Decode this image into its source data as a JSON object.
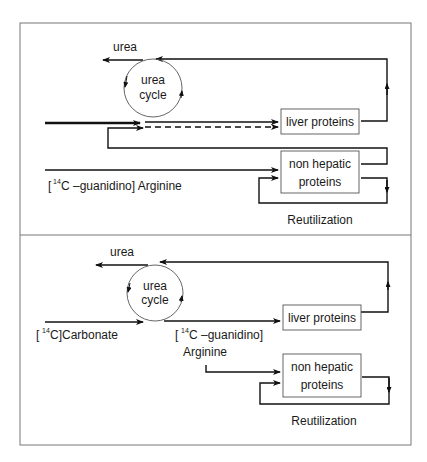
{
  "diagram": {
    "panels": [
      {
        "id": "top",
        "urea_label": "urea",
        "cycle_label_1": "urea",
        "cycle_label_2": "cycle",
        "liver_box": "liver proteins",
        "nonhep_box_1": "non hepatic",
        "nonhep_box_2": "proteins",
        "tracer_bracket_open": "[",
        "tracer_sup": "14",
        "tracer_rest": "C –guanidino]  Arginine",
        "reutilization": "Reutilization"
      },
      {
        "id": "bottom",
        "urea_label": "urea",
        "cycle_label_1": "urea",
        "cycle_label_2": "cycle",
        "liver_box": "liver proteins",
        "nonhep_box_1": "non hepatic",
        "nonhep_box_2": "proteins",
        "carbonate_open": "[",
        "carbonate_sup": "14",
        "carbonate_rest": "C]Carbonate",
        "tracer_bracket_open": "[",
        "tracer_sup": "14",
        "tracer_rest": "C –guanidino]",
        "tracer_line2": "Arginine",
        "reutilization": "Reutilization"
      }
    ],
    "colors": {
      "line": "#111111",
      "circle": "#555555",
      "border": "#777777"
    }
  }
}
